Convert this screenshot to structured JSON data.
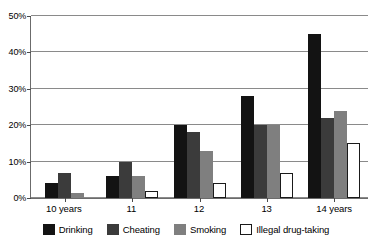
{
  "chart_data": {
    "type": "bar",
    "title": "",
    "xlabel": "",
    "ylabel": "",
    "ylim": [
      0,
      50
    ],
    "yticks": [
      0,
      10,
      20,
      30,
      40,
      50
    ],
    "ytick_labels": [
      "0%",
      "10%",
      "20%",
      "30%",
      "40%",
      "50%"
    ],
    "grid": true,
    "legend_position": "bottom",
    "categories": [
      "10 years",
      "11",
      "12",
      "13",
      "14 years"
    ],
    "series": [
      {
        "name": "Drinking",
        "color": "#131313",
        "values": [
          4,
          6,
          20,
          28,
          45
        ]
      },
      {
        "name": "Cheating",
        "color": "#3b3b3b",
        "values": [
          7,
          10,
          18,
          20,
          22
        ]
      },
      {
        "name": "Smoking",
        "color": "#7f7f7f",
        "values": [
          1.5,
          6,
          13,
          20,
          24
        ]
      },
      {
        "name": "Illegal drug-taking",
        "color": "#ffffff",
        "values": [
          0,
          2,
          4,
          7,
          15
        ]
      }
    ]
  }
}
